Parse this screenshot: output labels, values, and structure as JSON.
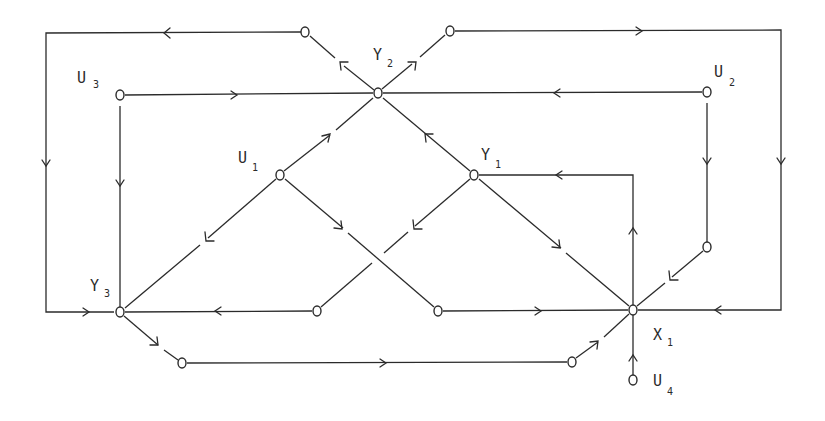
{
  "diagram": {
    "type": "signal-flow-graph",
    "labels": {
      "U1": {
        "main": "U",
        "sub": "1"
      },
      "U2": {
        "main": "U",
        "sub": "2"
      },
      "U3": {
        "main": "U",
        "sub": "3"
      },
      "U4": {
        "main": "U",
        "sub": "4"
      },
      "Y1": {
        "main": "Y",
        "sub": "1"
      },
      "Y2": {
        "main": "Y",
        "sub": "2"
      },
      "Y3": {
        "main": "Y",
        "sub": "3"
      },
      "X1": {
        "main": "X",
        "sub": "1"
      }
    },
    "nodes": [
      {
        "id": "n_top_left",
        "x": 305,
        "y": 32
      },
      {
        "id": "n_top_right",
        "x": 450,
        "y": 31
      },
      {
        "id": "U3",
        "x": 120,
        "y": 95
      },
      {
        "id": "Y2",
        "x": 378,
        "y": 93
      },
      {
        "id": "U2",
        "x": 707,
        "y": 92
      },
      {
        "id": "U1",
        "x": 280,
        "y": 175
      },
      {
        "id": "Y1",
        "x": 474,
        "y": 175
      },
      {
        "id": "n_right_mid",
        "x": 707,
        "y": 247
      },
      {
        "id": "Y3",
        "x": 120,
        "y": 312
      },
      {
        "id": "n_mid_left",
        "x": 317,
        "y": 311
      },
      {
        "id": "n_mid_right",
        "x": 438,
        "y": 311
      },
      {
        "id": "X1",
        "x": 633,
        "y": 310
      },
      {
        "id": "n_bot_left",
        "x": 182,
        "y": 363
      },
      {
        "id": "n_bot_right",
        "x": 572,
        "y": 362
      },
      {
        "id": "U4",
        "x": 633,
        "y": 380
      }
    ],
    "edges": [
      {
        "from": "Y2",
        "to": "n_top_left"
      },
      {
        "from": "Y2",
        "to": "n_top_right"
      },
      {
        "from": "n_top_left",
        "to": "Y3",
        "route": "outer-left-loop"
      },
      {
        "from": "n_top_right",
        "to": "X1",
        "route": "outer-right-loop"
      },
      {
        "from": "U3",
        "to": "Y2"
      },
      {
        "from": "U3",
        "to": "Y3"
      },
      {
        "from": "U2",
        "to": "Y2"
      },
      {
        "from": "U2",
        "to": "n_right_mid"
      },
      {
        "from": "U1",
        "to": "Y2"
      },
      {
        "from": "U1",
        "to": "Y3"
      },
      {
        "from": "U1",
        "to": "n_mid_right"
      },
      {
        "from": "Y1",
        "to": "Y2"
      },
      {
        "from": "Y1",
        "to": "n_mid_left"
      },
      {
        "from": "Y1",
        "to": "X1"
      },
      {
        "from": "X1",
        "to": "Y1",
        "route": "up-and-left"
      },
      {
        "from": "n_right_mid",
        "to": "X1"
      },
      {
        "from": "n_mid_left",
        "to": "Y3"
      },
      {
        "from": "n_mid_right",
        "to": "X1"
      },
      {
        "from": "Y3",
        "to": "n_bot_left"
      },
      {
        "from": "n_bot_left",
        "to": "n_bot_right"
      },
      {
        "from": "n_bot_right",
        "to": "X1"
      },
      {
        "from": "U4",
        "to": "X1"
      }
    ]
  }
}
